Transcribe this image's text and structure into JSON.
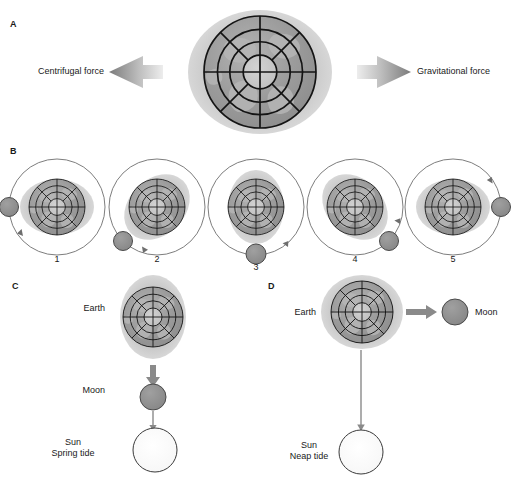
{
  "figure": {
    "width": 511,
    "height": 481,
    "background": "#ffffff"
  },
  "colors": {
    "ink": "#1a1a1a",
    "earth_body": "#9a9a9a",
    "earth_core": "#c4c4c4",
    "earth_grid": "#141414",
    "bulge": "#c9c9c9",
    "moon_fill": "#8e8e8e",
    "moon_stroke": "#4a4a4a",
    "sun_fill": "#fbfbfb",
    "sun_stroke": "#3a3a3a",
    "orbit_stroke": "#6e6e6e",
    "arrow_dark": "#7d7d7d",
    "arrow_light": "#ececec",
    "thin_arrow": "#8a8a8a"
  },
  "panels": {
    "a": {
      "letter": "A",
      "left_force_label": "Centrifugal force",
      "right_force_label": "Gravitational force",
      "bulge_orientation": "horizontal",
      "earth": {
        "cx": 260,
        "cy": 72,
        "r": 56
      }
    },
    "b": {
      "letter": "B",
      "caption_numbers": [
        "1",
        "2",
        "3",
        "4",
        "5"
      ],
      "orbit_direction": "counterclockwise",
      "steps": [
        {
          "number": "1",
          "moon_angle_deg": 180,
          "bulge_angle_deg": 0,
          "cx": 57,
          "cy": 207
        },
        {
          "number": "2",
          "moon_angle_deg": 225,
          "bulge_angle_deg": 45,
          "cx": 157,
          "cy": 207
        },
        {
          "number": "3",
          "moon_angle_deg": 270,
          "bulge_angle_deg": 90,
          "cx": 256,
          "cy": 207
        },
        {
          "number": "4",
          "moon_angle_deg": 315,
          "bulge_angle_deg": 135,
          "cx": 355,
          "cy": 207
        },
        {
          "number": "5",
          "moon_angle_deg": 0,
          "bulge_angle_deg": 0,
          "cx": 453,
          "cy": 207
        }
      ]
    },
    "c": {
      "letter": "C",
      "earth_label": "Earth",
      "moon_label": "Moon",
      "sun_label_line1": "Sun",
      "sun_label_line2": "Spring tide",
      "alignment": "earth-moon-sun collinear (vertical)",
      "bulge_orientation": "vertical"
    },
    "d": {
      "letter": "D",
      "earth_label": "Earth",
      "moon_label": "Moon",
      "sun_label_line1": "Sun",
      "sun_label_line2": "Neap tide",
      "alignment": "moon at right angle to sun",
      "bulge_orientation": "near-circular"
    }
  }
}
